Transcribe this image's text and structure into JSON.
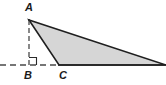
{
  "figure": {
    "kind": "geometry-diagram",
    "canvas": {
      "width": 166,
      "height": 85
    },
    "colors": {
      "background": "#ffffff",
      "triangle_fill": "#d6d6d6",
      "triangle_stroke": "#1f1f1f",
      "construction_line": "#4a4a4a",
      "label_color": "#1a1a1a",
      "right_angle_marker": "#2a2a2a"
    },
    "points": {
      "A": {
        "label": "A",
        "x": 29,
        "y": 20
      },
      "B": {
        "label": "B",
        "x": 29,
        "y": 65
      },
      "C": {
        "label": "C",
        "x": 59,
        "y": 65
      },
      "D": {
        "label": "",
        "x": 166,
        "y": 65
      }
    },
    "labels": [
      {
        "name": "vertex-label-a",
        "text": "A"
      },
      {
        "name": "vertex-label-b",
        "text": "B"
      },
      {
        "name": "vertex-label-c",
        "text": "C"
      }
    ],
    "shapes": {
      "triangle_polygon": "29,20 59,65 166,65",
      "altitude_dashed": {
        "x1": 29,
        "y1": 20,
        "x2": 29,
        "y2": 65
      },
      "baseline_dashed": {
        "x1": 0,
        "y1": 65,
        "x2": 59,
        "y2": 65
      },
      "baseline_solid": {
        "x1": 59,
        "y1": 65,
        "x2": 166,
        "y2": 65
      },
      "right_angle_marker": {
        "x": 29,
        "y": 57,
        "size": 8,
        "at": "B"
      }
    },
    "stroke_widths": {
      "triangle": 1.6,
      "dashed": 1.3,
      "baseline": 1.6,
      "marker": 1.1
    },
    "dash_patterns": {
      "altitude": "5 3",
      "baseline": "6 4"
    }
  }
}
